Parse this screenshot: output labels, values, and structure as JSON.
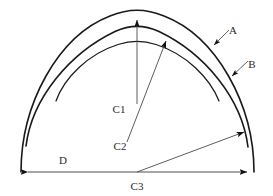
{
  "diagram": {
    "type": "geometric-line-drawing",
    "background_color": "#ffffff",
    "line_color": "#1a1a1a",
    "dimension_color": "#4a4a4a",
    "labels": {
      "a": "A",
      "b": "B",
      "c1": "C1",
      "c2": "C2",
      "c3": "C3",
      "d": "D"
    },
    "label_positions": {
      "a": {
        "x": 233,
        "y": 34
      },
      "b": {
        "x": 252,
        "y": 68
      },
      "c1": {
        "x": 112,
        "y": 113
      },
      "c2": {
        "x": 113,
        "y": 150
      },
      "c3": {
        "x": 131,
        "y": 189
      },
      "d": {
        "x": 61,
        "y": 163
      }
    },
    "annotations": [
      {
        "name": "arrow-to-arc-a",
        "label": "A",
        "from": {
          "x": 228,
          "y": 30
        },
        "to": {
          "x": 211,
          "y": 47
        }
      },
      {
        "name": "arrow-to-arc-b",
        "label": "B",
        "from": {
          "x": 247,
          "y": 62
        },
        "to": {
          "x": 229,
          "y": 78
        }
      },
      {
        "name": "radius-c1",
        "label": "C1",
        "from": {
          "x": 137,
          "y": 105
        },
        "to": {
          "x": 137,
          "y": 14
        }
      },
      {
        "name": "radius-c2",
        "label": "C2",
        "from": {
          "x": 128,
          "y": 143
        },
        "to": {
          "x": 168,
          "y": 36
        }
      },
      {
        "name": "radius-c3",
        "label": "C3",
        "from": {
          "x": 137,
          "y": 172
        },
        "to": {
          "x": 247,
          "y": 131
        }
      },
      {
        "name": "span-d",
        "label": "D",
        "from": {
          "x": 21,
          "y": 172
        },
        "to": {
          "x": 254,
          "y": 172
        }
      }
    ],
    "geometry": {
      "baseline_y": 172,
      "span_left_x": 21,
      "span_right_x": 254,
      "centre_x": 137,
      "arc_outer_peak_y": 12,
      "arc_middle_peak_y": 28,
      "arc_inner_peak_y": 42
    }
  }
}
